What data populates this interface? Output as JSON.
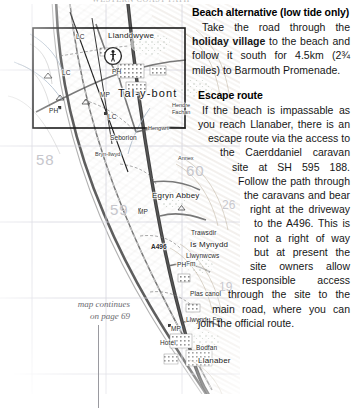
{
  "page": {
    "top_fragment": "WESTERN COAST PATH",
    "background": "#ffffff"
  },
  "map": {
    "continues_note_line1": "map continues",
    "continues_note_line2": "on page 69",
    "grid_numbers": [
      "58",
      "59",
      "60",
      "26",
      "19"
    ],
    "labels": [
      {
        "text": "Llanddwywe",
        "class": "lbl-place",
        "x": 108,
        "y": 28
      },
      {
        "text": "LC",
        "class": "lbl-small",
        "x": 76,
        "y": 30
      },
      {
        "text": "LC",
        "class": "lbl-small",
        "x": 62,
        "y": 66
      },
      {
        "text": "PH",
        "class": "lbl-small",
        "x": 112,
        "y": 65
      },
      {
        "text": "Tal-y-bont",
        "class": "lbl-town",
        "x": 118,
        "y": 84
      },
      {
        "text": "MP",
        "class": "lbl-small",
        "x": 100,
        "y": 88
      },
      {
        "text": "PH",
        "class": "lbl-small",
        "x": 49,
        "y": 104
      },
      {
        "text": "LC",
        "class": "lbl-small",
        "x": 108,
        "y": 110
      },
      {
        "text": "Hendre",
        "class": "lbl-tiny",
        "x": 172,
        "y": 99
      },
      {
        "text": "Fachan",
        "class": "lbl-tiny",
        "x": 172,
        "y": 106
      },
      {
        "text": "Hengwrt",
        "class": "lbl-tiny",
        "x": 148,
        "y": 122
      },
      {
        "text": "Seborion",
        "class": "lbl-small",
        "x": 110,
        "y": 131
      },
      {
        "text": "Bryn-llwyd",
        "class": "lbl-tiny",
        "x": 95,
        "y": 148
      },
      {
        "text": "Annex",
        "class": "lbl-tiny",
        "x": 178,
        "y": 152
      },
      {
        "text": "Egryn Abbey",
        "class": "lbl-place",
        "x": 152,
        "y": 188
      },
      {
        "text": "MP",
        "class": "lbl-small",
        "x": 138,
        "y": 205
      },
      {
        "text": "A496",
        "class": "lbl-road",
        "x": 151,
        "y": 240
      },
      {
        "text": "Trawsdir",
        "class": "lbl-small",
        "x": 191,
        "y": 226
      },
      {
        "text": "Is Mynydd",
        "class": "lbl-place",
        "x": 190,
        "y": 237
      },
      {
        "text": "Llwynwcws",
        "class": "lbl-small",
        "x": 186,
        "y": 249
      },
      {
        "text": "Fm",
        "class": "lbl-small",
        "x": 186,
        "y": 257
      },
      {
        "text": "PH",
        "class": "lbl-small",
        "x": 177,
        "y": 258
      },
      {
        "text": "Plas canol",
        "class": "lbl-small",
        "x": 190,
        "y": 287
      },
      {
        "text": "Llwyndu Fm",
        "class": "lbl-small",
        "x": 186,
        "y": 313
      },
      {
        "text": "MP",
        "class": "lbl-small",
        "x": 171,
        "y": 322
      },
      {
        "text": "Hotel",
        "class": "lbl-small",
        "x": 160,
        "y": 336
      },
      {
        "text": "Bodfan",
        "class": "lbl-small",
        "x": 196,
        "y": 341
      },
      {
        "text": "Llanaber",
        "class": "lbl-place",
        "x": 198,
        "y": 353
      },
      {
        "text": "58",
        "class": "lbl-grid",
        "x": 36,
        "y": 148
      },
      {
        "text": "59",
        "class": "lbl-grid",
        "x": 110,
        "y": 198
      },
      {
        "text": "60",
        "class": "lbl-grid",
        "x": 186,
        "y": 159
      },
      {
        "text": "26",
        "class": "lbl-gridsm",
        "x": 222,
        "y": 195
      },
      {
        "text": "19",
        "class": "lbl-gridsm",
        "x": 219,
        "y": 277
      }
    ]
  },
  "beach": {
    "heading": "Beach alternative (low tide only)",
    "body_1": "Take the road through the ",
    "body_bold_1": "holiday village",
    "body_2": " to the beach and follow it south for 4.5km (2¾ miles) to Barmouth Promenade."
  },
  "escape": {
    "heading": "Escape route",
    "body": "If the beach is impassable as you reach Llanaber, there is an escape route via the access to the Caerddaniel caravan site at SH 595 188. Follow the path through the caravans and bear right at the driveway to the A496. This is not a right of way but at present the site owners allow responsible access through the site to the main road, where you can join the official route."
  }
}
